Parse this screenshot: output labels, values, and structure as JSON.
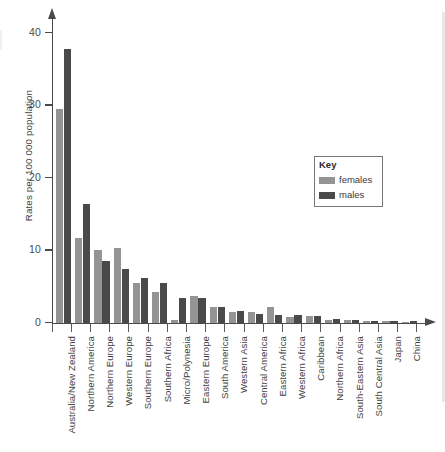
{
  "chart_data": {
    "type": "bar",
    "title": "",
    "subtitle": "",
    "xlabel": "",
    "ylabel": "Rates per 100 000 population",
    "ylim": [
      0,
      42
    ],
    "yticks": [
      0,
      10,
      20,
      30,
      40
    ],
    "ytick_labels": [
      "0",
      "10",
      "20",
      "30",
      "40"
    ],
    "grid": false,
    "legend_position": "inside-right",
    "legend_title": "Key",
    "categories": [
      "Australia/New Zealand",
      "Northern America",
      "Northern Europe",
      "Western Europe",
      "Southern Europe",
      "Southern Africa",
      "Micro/Polynesia",
      "Eastern Europe",
      "South America",
      "Western Asia",
      "Central America",
      "Eastern Africa",
      "Western Africa",
      "Caribbean",
      "Northern Africa",
      "South-Eastern Asia",
      "South Central Asia",
      "Japan",
      "China"
    ],
    "series": [
      {
        "name": "females",
        "color": "#949494",
        "values": [
          29.4,
          11.7,
          10.0,
          10.3,
          5.5,
          4.2,
          0.3,
          3.7,
          2.2,
          1.4,
          1.4,
          2.1,
          0.7,
          0.9,
          0.3,
          0.3,
          0.15,
          0.15,
          0.1
        ]
      },
      {
        "name": "males",
        "color": "#4a4a4a",
        "values": [
          37.7,
          16.3,
          8.5,
          7.4,
          6.1,
          5.5,
          3.4,
          3.4,
          2.2,
          1.6,
          1.2,
          1.0,
          1.0,
          0.9,
          0.5,
          0.3,
          0.2,
          0.15,
          0.15
        ]
      }
    ]
  },
  "legend": {
    "title": "Key",
    "entries": [
      {
        "label": "females",
        "swatch": "#949494"
      },
      {
        "label": "males",
        "swatch": "#4a4a4a"
      }
    ]
  },
  "axes": {
    "y_title": "Rates per 100 000 population"
  },
  "colors": {
    "female": "#949494",
    "male": "#4a4a4a",
    "axis": "#4a4a4a",
    "background": "#ffffff"
  }
}
